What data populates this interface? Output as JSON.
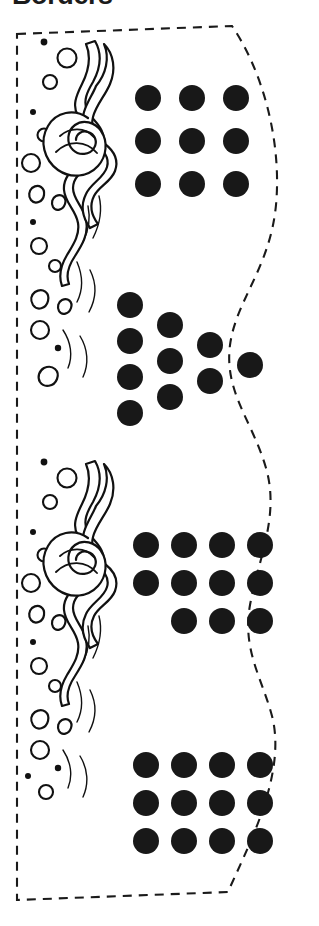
{
  "page": {
    "title": "Borders",
    "background_color": "#ffffff",
    "width": 319,
    "height": 926
  },
  "cut_sheet": {
    "name": "dashed-cut-panel",
    "cut_line_color": "#1a1a1a",
    "cut_line_style": "dashed",
    "left_edge": "straight-vertical",
    "right_edge": "wavy-scalloped",
    "top_edge": "horizontal-then-angled",
    "bottom_edge": "horizontal-then-angled"
  },
  "flourish": {
    "name": "wave-flame-ornament",
    "description": "repeating curling wave and flame scroll with bubble circles",
    "repeats": 2,
    "ink_color": "#111111",
    "fill_color": "#ffffff"
  },
  "dot_style": {
    "color": "#181818",
    "shape": "circle"
  },
  "chart_data": {
    "type": "scatter",
    "title": "Borders",
    "xlabel": "",
    "ylabel": "",
    "groups": [
      {
        "name": "group-1-square-grid",
        "arrangement": "3x3 grid",
        "count": 9,
        "rows": [
          3,
          3,
          3
        ],
        "dot_radius": 13,
        "origin": {
          "x": 148,
          "y": 98
        },
        "spacing_x": 44,
        "spacing_y": 43
      },
      {
        "name": "group-2-staircase",
        "arrangement": "descending staircase columns",
        "count": 10,
        "columns": [
          4,
          3,
          2,
          1
        ],
        "dot_radius": 13,
        "origin": {
          "x": 130,
          "y": 305
        },
        "spacing_x": 40,
        "spacing_y": 36,
        "column_offset_y": 20
      },
      {
        "name": "group-3-offset-grid",
        "arrangement": "4 x 4 x 3 offset rows",
        "count": 11,
        "rows": [
          4,
          4,
          3
        ],
        "last_row_offset_columns": 1,
        "dot_radius": 13,
        "origin": {
          "x": 146,
          "y": 545
        },
        "spacing_x": 38,
        "spacing_y": 38
      },
      {
        "name": "group-4-full-grid",
        "arrangement": "4x3 grid",
        "count": 12,
        "rows": [
          4,
          4,
          4
        ],
        "dot_radius": 13,
        "origin": {
          "x": 146,
          "y": 765
        },
        "spacing_x": 38,
        "spacing_y": 38
      }
    ],
    "total_dots": 42
  }
}
